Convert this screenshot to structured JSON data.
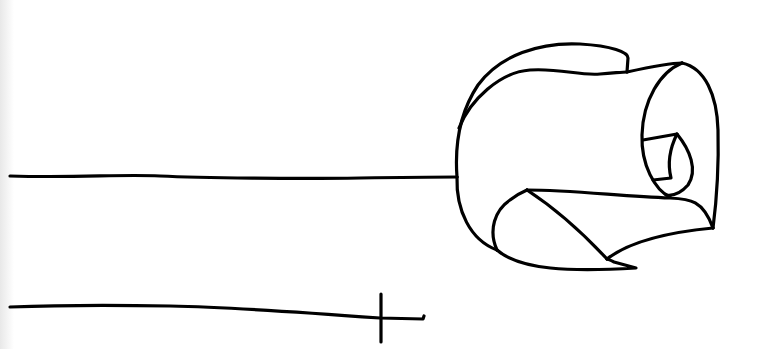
{
  "drawing": {
    "description": "Hand-drawn black ink line sketch on white paper",
    "stroke_color": "#000000",
    "background_color": "#ffffff",
    "elements": [
      {
        "name": "upper-line",
        "desc": "Long horizontal line connecting to a rolled scroll/rose-like shape"
      },
      {
        "name": "rolled-shape",
        "desc": "Curled, rolled shape resembling a scroll or rose bud"
      },
      {
        "name": "lower-line",
        "desc": "Long horizontal line ending with a small cross tick"
      }
    ]
  }
}
